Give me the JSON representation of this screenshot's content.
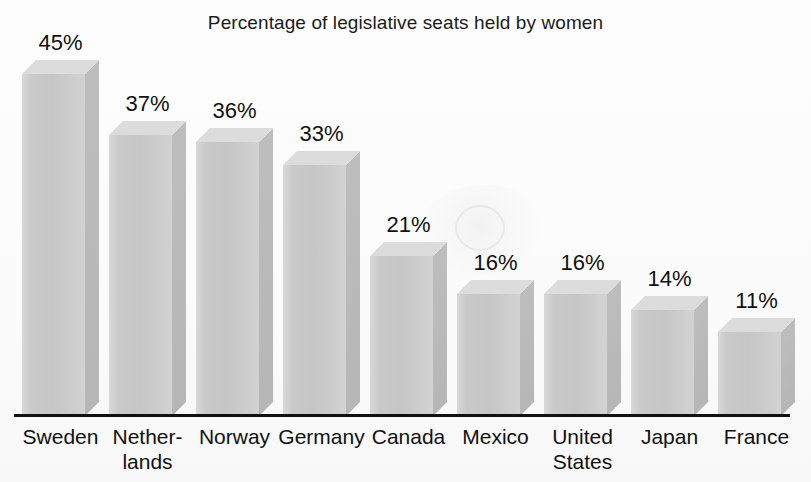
{
  "chart_data": {
    "type": "bar",
    "title": "Percentage of legislative seats held by women",
    "xlabel": "",
    "ylabel": "",
    "ylim": [
      0,
      48
    ],
    "grid": false,
    "legend": "none",
    "value_suffix": "%",
    "categories": [
      "Sweden",
      "Nether-\nlands",
      "Norway",
      "Germany",
      "Canada",
      "Mexico",
      "United\nStates",
      "Japan",
      "France"
    ],
    "values": [
      45,
      37,
      36,
      33,
      21,
      16,
      16,
      14,
      11
    ],
    "value_labels": [
      "45%",
      "37%",
      "36%",
      "33%",
      "21%",
      "16%",
      "16%",
      "14%",
      "11%"
    ]
  },
  "style": {
    "background": "#fdfdfd",
    "bar_front": "#c9c9c9",
    "bar_top": "#dcdcdc",
    "bar_side": "#bdbdbd",
    "axis_color": "#111111",
    "text_color": "#111111"
  }
}
